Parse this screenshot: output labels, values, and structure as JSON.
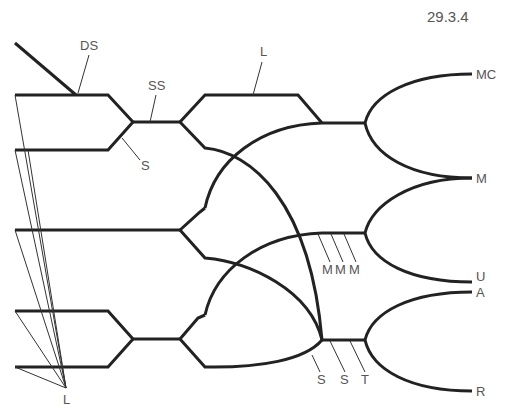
{
  "figure": {
    "number": "29.3.4",
    "line_color": "#222222",
    "label_color": "#555555"
  },
  "labels": {
    "ds": "DS",
    "ss": "SS",
    "s_upper": "S",
    "l_top": "L",
    "l_bottom": "L",
    "mc": "MC",
    "m": "M",
    "u": "U",
    "a": "A",
    "r": "R",
    "m1": "M",
    "m2": "M",
    "m3": "M",
    "s_lower_1": "S",
    "s_lower_2": "S",
    "t": "T"
  }
}
